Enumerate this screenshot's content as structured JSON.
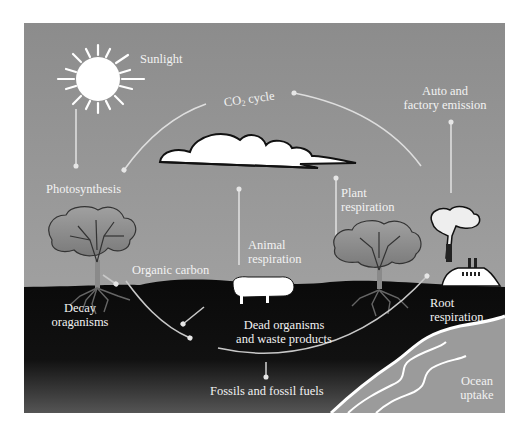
{
  "diagram": {
    "colors": {
      "sky_top": "#8a8a8a",
      "sky_bottom": "#a8a8a8",
      "ground": "#0c0c0c",
      "ground_bottom": "#4a4a4a",
      "ocean": "#9a9a9a",
      "arrow": "#dcdcdc",
      "label": "#f2f2f2"
    },
    "labels": {
      "sunlight": "Sunlight",
      "co2_prefix": "CO",
      "co2_sub": "2",
      "co2_suffix": " cycle",
      "auto_line1": "Auto and",
      "auto_line2": "factory emission",
      "photosynthesis": "Photosynthesis",
      "plant_line1": "Plant",
      "plant_line2": "respiration",
      "animal_line1": "Animal",
      "animal_line2": "respiration",
      "organic_carbon": "Organic carbon",
      "decay_line1": "Decay",
      "decay_line2": "oraganisms",
      "dead_line1": "Dead organisms",
      "dead_line2": "and waste products",
      "root_line1": "Root",
      "root_line2": "respiration",
      "fossils": "Fossils and fossil fuels",
      "ocean_line1": "Ocean",
      "ocean_line2": "uptake"
    },
    "elements": [
      "sun",
      "cloud",
      "tree-left",
      "tree-right",
      "sheep",
      "factory",
      "ocean",
      "ground"
    ]
  }
}
